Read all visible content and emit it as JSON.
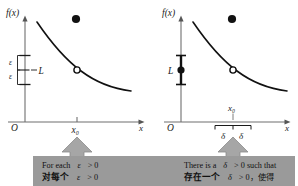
{
  "figure": {
    "title_semantic": "epsilon-delta definition of limit, two-panel illustration",
    "colors": {
      "ink": "#1a1a1a",
      "axis": "#6f6f6f",
      "curve": "#111111",
      "panel_band": "#9a9a9a",
      "arrow_fill": "#a6a6a6",
      "arrow_stroke": "#7d7d7d",
      "background": "#ffffff"
    }
  },
  "left_panel": {
    "name": "epsilon-panel",
    "y_axis_label": "f(x)",
    "x_axis_label": "x",
    "origin_label": "O",
    "x0_label": "x₀",
    "limit_label": "L",
    "epsilon_upper_label": "ε",
    "epsilon_lower_label": "ε",
    "filled_point": true,
    "open_point": true
  },
  "right_panel": {
    "name": "delta-panel",
    "y_axis_label": "f(x)",
    "x_axis_label": "x",
    "origin_label": "O",
    "x0_label": "x₀",
    "limit_label": "L",
    "delta_left_label": "δ",
    "delta_right_label": "δ",
    "filled_point": true,
    "open_point": true
  },
  "captions": {
    "left": {
      "line1_pre": "For each",
      "line1_sym": "ε",
      "line1_post": "> 0",
      "line2_pre": "对每个",
      "line2_sym": "ε",
      "line2_post": "> 0"
    },
    "right": {
      "line1_pre": "There is a",
      "line1_sym": "δ",
      "line1_post": "> 0 such that",
      "line2_pre": "存在一个",
      "line2_sym": "δ",
      "line2_post": "> 0，使得"
    }
  }
}
